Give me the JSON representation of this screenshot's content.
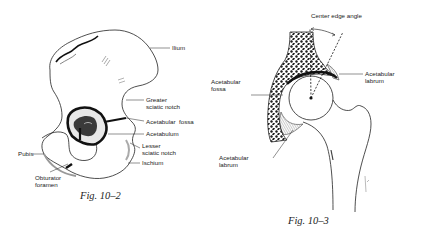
{
  "figures": [
    {
      "id": "fig-10-2",
      "caption": "Fig. 10–2",
      "labels": {
        "ilium": "Ilium",
        "greater_sciatic_notch": "Greater\nsciatic notch",
        "acetabular_fossa": "Acetabular  fossa",
        "acetabulum": "Acetabulum",
        "lesser_sciatic_notch": "Lesser\nsciatic notch",
        "ischium": "Ischium",
        "pubis": "Pubis",
        "obturator_foramen": "Obturator\nforamen"
      }
    },
    {
      "id": "fig-10-3",
      "caption": "Fig. 10–3",
      "labels": {
        "center_edge_angle": "Center edge angle",
        "acetabular_fossa": "Acetabular\nfossa",
        "acetabular_labrum_upper": "Acetabular\nlabrum",
        "acetabular_labrum_lower": "Acetabular\nlabrum"
      }
    }
  ],
  "colors": {
    "ink": "#1a1a1a",
    "background": "#ffffff"
  }
}
